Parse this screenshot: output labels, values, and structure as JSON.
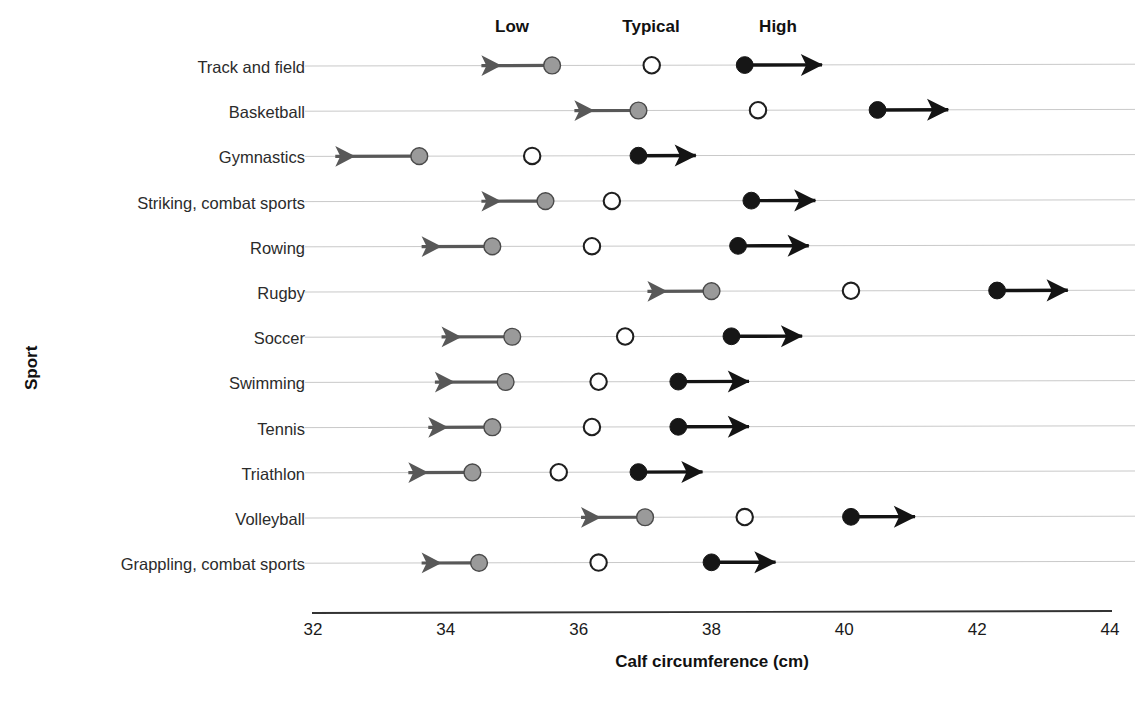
{
  "chart_data": {
    "type": "scatter",
    "title": "",
    "xlabel": "Calf circumference (cm)",
    "ylabel": "Sport",
    "xlim": [
      32,
      44
    ],
    "xticks": [
      32,
      34,
      36,
      38,
      40,
      42,
      44
    ],
    "xtick_labels": [
      "32",
      "34",
      "36",
      "38",
      "40",
      "42",
      "44"
    ],
    "grid": true,
    "legend_position": "top",
    "legend": [
      "Low",
      "Typical",
      "High"
    ],
    "series_styles": {
      "Low": {
        "marker": "circle-gray",
        "color": "#999999",
        "arrow": "left",
        "arrow_color": "#555555"
      },
      "Typical": {
        "marker": "circle-open",
        "color": "#ffffff",
        "edge": "#222222"
      },
      "High": {
        "marker": "circle-black",
        "color": "#1a1a1a",
        "arrow": "right",
        "arrow_color": "#1a1a1a"
      }
    },
    "categories": [
      "Track and field",
      "Basketball",
      "Gymnastics",
      "Striking, combat sports",
      "Rowing",
      "Rugby",
      "Soccer",
      "Swimming",
      "Tennis",
      "Triathlon",
      "Volleyball",
      "Grappling, combat sports"
    ],
    "series": [
      {
        "name": "Low",
        "values": [
          35.6,
          36.9,
          33.6,
          35.5,
          34.7,
          38.0,
          35.0,
          34.9,
          34.7,
          34.4,
          37.0,
          34.5
        ],
        "arrow_ends": [
          34.4,
          35.8,
          32.2,
          34.4,
          33.5,
          36.9,
          33.8,
          33.7,
          33.6,
          33.3,
          35.9,
          33.5
        ]
      },
      {
        "name": "Typical",
        "values": [
          37.1,
          38.7,
          35.3,
          36.5,
          36.2,
          40.1,
          36.7,
          36.3,
          36.2,
          35.7,
          38.5,
          36.3
        ]
      },
      {
        "name": "High",
        "values": [
          38.5,
          40.5,
          36.9,
          38.6,
          38.4,
          42.3,
          38.3,
          37.5,
          37.5,
          36.9,
          40.1,
          38.0
        ],
        "arrow_ends": [
          39.8,
          41.7,
          37.9,
          39.7,
          39.6,
          43.5,
          39.5,
          38.7,
          38.7,
          38.0,
          41.2,
          39.1
        ]
      }
    ]
  },
  "axis": {
    "x_title": "Calf circumference (cm)",
    "y_title": "Sport"
  }
}
